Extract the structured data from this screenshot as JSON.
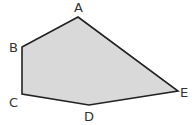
{
  "figure": {
    "type": "pentagon",
    "fill_color": "#d9d9d9",
    "stroke_color": "#222222",
    "vertices": [
      {
        "label": "A"
      },
      {
        "label": "E"
      },
      {
        "label": "D"
      },
      {
        "label": "C"
      },
      {
        "label": "B"
      }
    ]
  }
}
